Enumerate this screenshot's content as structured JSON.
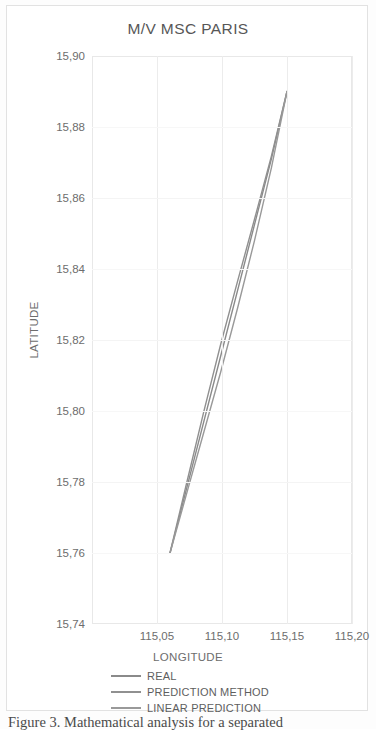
{
  "figure": {
    "caption": "Figure 3. Mathematical analysis for a separated"
  },
  "chart_data": {
    "type": "line",
    "title": "M/V MSC PARIS",
    "xlabel": "LONGITUDE",
    "ylabel": "LATITUDE",
    "xlim": [
      115.0,
      115.2
    ],
    "ylim": [
      15.74,
      15.9
    ],
    "xticks": [
      "115,05",
      "115,10",
      "115,15",
      "115,20"
    ],
    "xtick_values": [
      115.05,
      115.1,
      115.15,
      115.2
    ],
    "yticks": [
      "15,90",
      "15,88",
      "15,86",
      "15,84",
      "15,82",
      "15,80",
      "15,78",
      "15,76",
      "15,74"
    ],
    "ytick_values": [
      15.9,
      15.88,
      15.86,
      15.84,
      15.82,
      15.8,
      15.78,
      15.76,
      15.74
    ],
    "grid": true,
    "legend_position": "bottom",
    "series": [
      {
        "name": "REAL",
        "color": "#8a8a8a",
        "x": [
          115.06,
          115.073,
          115.086,
          115.099,
          115.112,
          115.125,
          115.138,
          115.15
        ],
        "y": [
          15.76,
          15.7785,
          15.797,
          15.8155,
          15.834,
          15.8525,
          15.871,
          15.89
        ]
      },
      {
        "name": "PREDICTION METHOD",
        "color": "#909090",
        "x": [
          115.06,
          115.073,
          115.086,
          115.099,
          115.112,
          115.125,
          115.138,
          115.15
        ],
        "y": [
          15.76,
          15.78,
          15.7998,
          15.8188,
          15.8366,
          15.854,
          15.8718,
          15.89
        ]
      },
      {
        "name": "LINEAR PREDICTION",
        "color": "#999999",
        "x": [
          115.06,
          115.073,
          115.086,
          115.099,
          115.112,
          115.125,
          115.138,
          115.15
        ],
        "y": [
          15.76,
          15.777,
          15.794,
          15.811,
          15.829,
          15.848,
          15.8685,
          15.89
        ]
      }
    ]
  },
  "legend": {
    "items": [
      {
        "label": "REAL",
        "color": "#8a8a8a"
      },
      {
        "label": "PREDICTION METHOD",
        "color": "#909090"
      },
      {
        "label": "LINEAR PREDICTION",
        "color": "#999999"
      }
    ]
  }
}
